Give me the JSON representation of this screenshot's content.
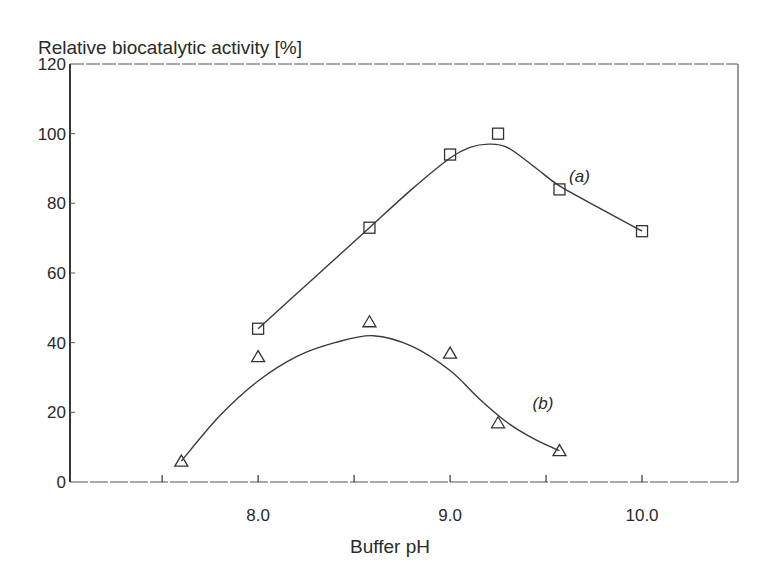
{
  "chart_data": {
    "type": "line",
    "title": "",
    "xlabel": "Buffer pH",
    "ylabel": "Relative biocatalytic activity [%]",
    "xlim": [
      7.02,
      10.5
    ],
    "ylim": [
      0,
      120
    ],
    "x_ticks": [
      7.5,
      8.0,
      8.5,
      9.0,
      9.5,
      10.0
    ],
    "x_tick_labels": [
      {
        "value": 8.0,
        "label": "8.0"
      },
      {
        "value": 9.0,
        "label": "9.0"
      },
      {
        "value": 10.0,
        "label": "10.0"
      }
    ],
    "y_ticks": [
      0,
      20,
      40,
      60,
      80,
      100,
      120
    ],
    "y_tick_labels": [
      "0",
      "20",
      "40",
      "60",
      "80",
      "100",
      "120"
    ],
    "grid": false,
    "legend": "inline labels",
    "series": [
      {
        "name": "(a)",
        "marker": "square",
        "label_pos": {
          "x": 9.62,
          "y": 86
        },
        "points": [
          {
            "x": 8.0,
            "y": 44
          },
          {
            "x": 8.58,
            "y": 73
          },
          {
            "x": 9.0,
            "y": 94
          },
          {
            "x": 9.25,
            "y": 100
          },
          {
            "x": 9.57,
            "y": 84
          },
          {
            "x": 10.0,
            "y": 72
          }
        ],
        "curve": [
          {
            "x": 8.0,
            "y": 44
          },
          {
            "x": 8.3,
            "y": 59
          },
          {
            "x": 8.58,
            "y": 73
          },
          {
            "x": 8.8,
            "y": 84
          },
          {
            "x": 9.0,
            "y": 93
          },
          {
            "x": 9.1,
            "y": 96
          },
          {
            "x": 9.2,
            "y": 97
          },
          {
            "x": 9.3,
            "y": 96
          },
          {
            "x": 9.45,
            "y": 90
          },
          {
            "x": 9.57,
            "y": 85
          },
          {
            "x": 9.8,
            "y": 78
          },
          {
            "x": 10.0,
            "y": 72
          }
        ]
      },
      {
        "name": "(b)",
        "marker": "triangle",
        "label_pos": {
          "x": 9.43,
          "y": 21
        },
        "points": [
          {
            "x": 7.6,
            "y": 6
          },
          {
            "x": 8.0,
            "y": 36
          },
          {
            "x": 8.58,
            "y": 46
          },
          {
            "x": 9.0,
            "y": 37
          },
          {
            "x": 9.25,
            "y": 17
          },
          {
            "x": 9.57,
            "y": 9
          }
        ],
        "curve": [
          {
            "x": 7.6,
            "y": 6
          },
          {
            "x": 7.8,
            "y": 19
          },
          {
            "x": 8.0,
            "y": 29
          },
          {
            "x": 8.2,
            "y": 36
          },
          {
            "x": 8.4,
            "y": 40
          },
          {
            "x": 8.6,
            "y": 42
          },
          {
            "x": 8.8,
            "y": 39
          },
          {
            "x": 9.0,
            "y": 32
          },
          {
            "x": 9.15,
            "y": 24
          },
          {
            "x": 9.3,
            "y": 17
          },
          {
            "x": 9.45,
            "y": 12
          },
          {
            "x": 9.57,
            "y": 9
          }
        ]
      }
    ]
  },
  "style": {
    "ink": "#2a2a2a",
    "line": "#3a3a3a",
    "frame": "#555555"
  },
  "layout": {
    "plot_left": 70,
    "plot_right": 738,
    "plot_top": 64,
    "plot_bottom": 482
  }
}
